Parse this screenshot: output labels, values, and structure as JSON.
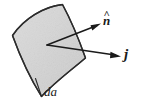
{
  "figure": {
    "kind": "physics-vector-diagram",
    "caption_visible": false,
    "background_color": "#ffffff",
    "surface_patch": {
      "name": "curved-surface-element",
      "fill_color": "#d6d6d6",
      "stroke_color": "#2b2b2b",
      "stroke_width": 1.4,
      "description": "curved quadrilateral surface element"
    },
    "vectors": [
      {
        "id": "normal",
        "label": "n",
        "accent": "^",
        "label_full": "n̂",
        "color": "#1a1a1a",
        "from": [
          47,
          45
        ],
        "to": [
          100,
          24
        ]
      },
      {
        "id": "current-density",
        "label": "j",
        "accent": "",
        "label_full": "j",
        "color": "#1a1a1a",
        "from": [
          47,
          45
        ],
        "to": [
          121,
          56
        ]
      }
    ],
    "area_label": {
      "id": "area-element",
      "text": "da",
      "color": "#1a1a1a"
    }
  }
}
